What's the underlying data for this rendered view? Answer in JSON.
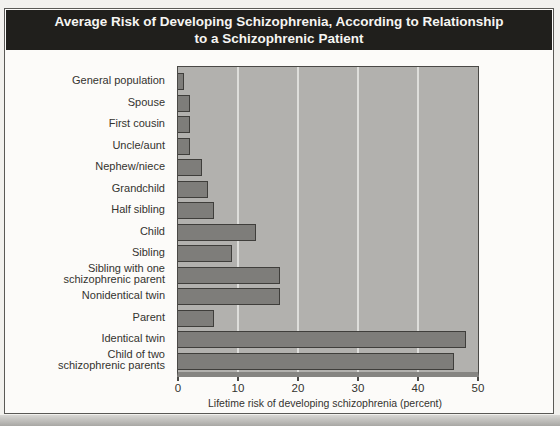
{
  "title": {
    "line1": "Average Risk of Developing Schizophrenia, According to Relationship",
    "line2": "to a Schizophrenic Patient"
  },
  "chart_data": {
    "type": "bar",
    "orientation": "horizontal",
    "title": "Average Risk of Developing Schizophrenia, According to Relationship to a Schizophrenic Patient",
    "categories": [
      "General population",
      "Spouse",
      "First cousin",
      "Uncle/aunt",
      "Nephew/niece",
      "Grandchild",
      "Half sibling",
      "Child",
      "Sibling",
      "Sibling with one\nschizophrenic parent",
      "Nonidentical twin",
      "Parent",
      "Identical twin",
      "Child of two\nschizophrenic parents"
    ],
    "values": [
      1,
      2,
      2,
      2,
      4,
      5,
      6,
      13,
      9,
      17,
      17,
      6,
      48,
      46
    ],
    "unit": "percent",
    "xlabel": "Lifetime risk of developing schizophrenia (percent)",
    "xlim": [
      0,
      50
    ],
    "xticks": [
      0,
      10,
      20,
      30,
      40,
      50
    ],
    "gridlines": [
      10,
      20,
      30,
      40
    ],
    "grid": "vertical light lines",
    "legend": null
  },
  "colors": {
    "title_band_bg": "#201f1c",
    "title_text": "#f6f5f2",
    "figure_bg": "#fcfbf9",
    "plot_bg": "#b2b1ae",
    "bar_fill": "#7e7d7a",
    "bar_border": "#3f3e3b",
    "gridline": "#dededb",
    "axis_text": "#34332f"
  }
}
